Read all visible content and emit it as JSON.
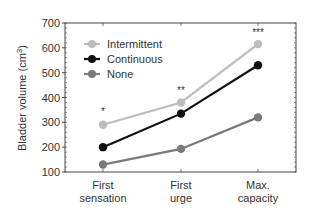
{
  "chart_data": {
    "type": "line",
    "title": "",
    "xlabel": "",
    "ylabel": "Bladder volume (cm³)",
    "ylabel_parts": {
      "main": "Bladder volume (cm",
      "sup": "3",
      "end": ")"
    },
    "ylim": [
      100,
      700
    ],
    "yticks": [
      100,
      200,
      300,
      400,
      500,
      600,
      700
    ],
    "categories": [
      {
        "line1": "First",
        "line2": "sensation"
      },
      {
        "line1": "First",
        "line2": "urge"
      },
      {
        "line1": "Max.",
        "line2": "capacity"
      }
    ],
    "series": [
      {
        "name": "Intermittent",
        "color": "#bdbdbd",
        "values": [
          290,
          380,
          615
        ]
      },
      {
        "name": "Continuous",
        "color": "#111111",
        "values": [
          200,
          335,
          530
        ]
      },
      {
        "name": "None",
        "color": "#7a7a7a",
        "values": [
          130,
          193,
          320
        ]
      }
    ],
    "annotations": [
      {
        "category": 0,
        "text": "*",
        "y": 345
      },
      {
        "category": 1,
        "text": "**",
        "y": 430
      },
      {
        "category": 2,
        "text": "***",
        "y": 665
      }
    ],
    "legend_position": "upper-left",
    "grid": false
  }
}
